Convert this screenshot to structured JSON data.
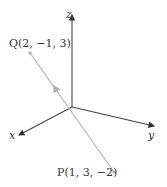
{
  "diagram": {
    "type": "3d-coordinate-axes",
    "axes": {
      "x_label": "x",
      "y_label": "y",
      "z_label": "z"
    },
    "points": [
      {
        "name": "Q",
        "label": "Q(2, −1, 3)",
        "coords": [
          2,
          -1,
          3
        ]
      },
      {
        "name": "P",
        "label": "P(1, 3, −2)",
        "coords": [
          1,
          3,
          -2
        ]
      }
    ],
    "segment": {
      "from": "P",
      "to": "Q",
      "direction_arrow": "toward Q"
    },
    "colors": {
      "axes": "#333333",
      "segment": "#b0b0b0",
      "text": "#333333"
    }
  }
}
